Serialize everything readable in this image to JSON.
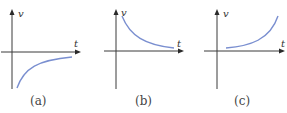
{
  "figure": {
    "panels": [
      {
        "id": "a",
        "caption": "(a)",
        "y_label": "v",
        "x_label": "t",
        "curve": "negative velocity increasing toward zero asymptotically (concave down, below t-axis)"
      },
      {
        "id": "b",
        "caption": "(b)",
        "y_label": "v",
        "x_label": "t",
        "curve": "positive velocity decreasing toward zero asymptotically"
      },
      {
        "id": "c",
        "caption": "(c)",
        "y_label": "v",
        "x_label": "t",
        "curve": "positive velocity increasing at a growing rate"
      }
    ],
    "colors": {
      "curve": "#7a8fd0",
      "axis": "#3a3a3a",
      "text": "#444444"
    }
  }
}
